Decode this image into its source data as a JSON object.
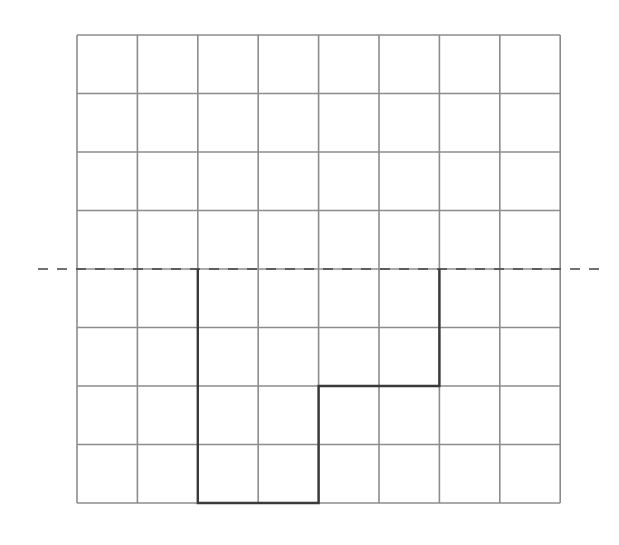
{
  "diagram": {
    "type": "grid-reflection",
    "canvas": {
      "width": 619,
      "height": 545
    },
    "grid": {
      "columns": 8,
      "rows": 8,
      "left": 77,
      "top": 35,
      "cell_width": 60.4,
      "cell_height": 58.5,
      "line_color": "#8c8c8c",
      "line_width": 1.6
    },
    "mirror_line": {
      "orientation": "horizontal",
      "grid_row_line": 4,
      "x_start": 38,
      "x_end": 603,
      "color": "#444444",
      "dash": "10,9",
      "line_width": 1.6
    },
    "shape": {
      "description": "L-shaped polygon below the mirror line",
      "vertices_grid": [
        [
          2,
          4
        ],
        [
          2,
          8
        ],
        [
          4,
          8
        ],
        [
          4,
          6
        ],
        [
          6,
          6
        ],
        [
          6,
          4
        ]
      ],
      "open_edge_on_mirror_line": true,
      "color": "#3a3a3a",
      "line_width": 2.4
    }
  }
}
